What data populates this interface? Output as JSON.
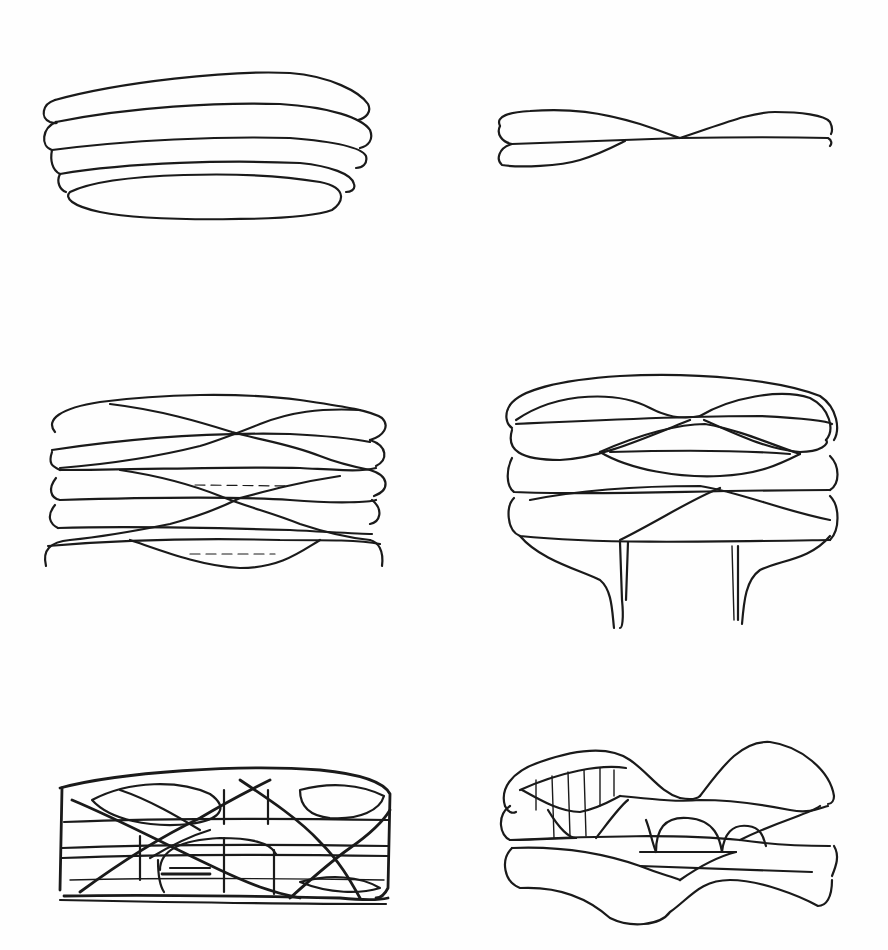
{
  "page": {
    "type": "sketch-sheet",
    "background": "#fefefe",
    "ink_color": "#1a1a1a"
  },
  "sketches": [
    {
      "id": 1,
      "position": "top-left",
      "subject": "stacked-rounded-slabs",
      "slab_count": 5
    },
    {
      "id": 2,
      "position": "top-right",
      "subject": "twisted-two-slab-ribbon",
      "slab_count": 2
    },
    {
      "id": 3,
      "position": "middle-left",
      "subject": "stacked-slabs-with-crossing-diagonals",
      "slab_count": 5
    },
    {
      "id": 4,
      "position": "middle-right",
      "subject": "lens-lattice-volume-on-two-pilotis",
      "support_count": 2
    },
    {
      "id": 5,
      "position": "bottom-left",
      "subject": "dense-diagrid-box-study"
    },
    {
      "id": 6,
      "position": "bottom-right",
      "subject": "undulating-layered-volume-with-arches"
    }
  ]
}
